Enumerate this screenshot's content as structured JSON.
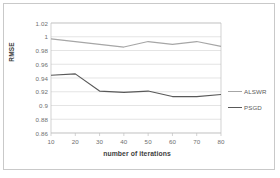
{
  "chart_data": {
    "type": "line",
    "title": "",
    "xlabel": "number of iterations",
    "ylabel": "RMSE",
    "x": [
      10,
      20,
      30,
      40,
      50,
      60,
      70,
      80
    ],
    "xtick_labels": [
      "10",
      "20",
      "30",
      "40",
      "50",
      "60",
      "70",
      "80"
    ],
    "ytick_labels": [
      "1.02",
      "1",
      "0.98",
      "0.96",
      "0.94",
      "0.92",
      "0.9",
      "0.88",
      "0.86"
    ],
    "ytick_values": [
      1.02,
      1.0,
      0.98,
      0.96,
      0.94,
      0.92,
      0.9,
      0.88,
      0.86
    ],
    "ylim": [
      0.86,
      1.02
    ],
    "xlim": [
      10,
      80
    ],
    "grid": "horizontal",
    "legend_position": "right",
    "series": [
      {
        "name": "ALSWR",
        "color": "#a6a6a6",
        "values": [
          0.997,
          0.993,
          0.989,
          0.985,
          0.993,
          0.989,
          0.993,
          0.986
        ]
      },
      {
        "name": "PSGD",
        "color": "#595959",
        "values": [
          0.944,
          0.946,
          0.921,
          0.919,
          0.921,
          0.913,
          0.913,
          0.916
        ]
      }
    ]
  },
  "plot": {
    "area": {
      "left": 47,
      "top": 19,
      "right": 217,
      "bottom": 129
    },
    "gridline_color": "#d9d9d9",
    "axis_color": "#bfbfbf",
    "background": "#ffffff"
  }
}
